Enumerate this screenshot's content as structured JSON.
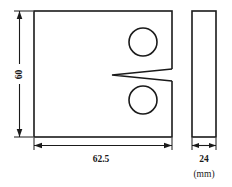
{
  "drawing": {
    "title": "CT specimen engineering drawing",
    "unit_label": "(mm)",
    "views": {
      "front": {
        "name": "front-view",
        "width_value": "62.5",
        "height_value": "60",
        "holes": [
          {
            "name": "upper-hole",
            "cx": 143,
            "cy": 42,
            "r": 14
          },
          {
            "name": "lower-hole",
            "cx": 143,
            "cy": 100,
            "r": 14
          }
        ],
        "notch": {
          "name": "v-notch",
          "tip_x": 112,
          "mouth_x": 172,
          "center_y": 75,
          "half_opening": 5.5
        },
        "rect": {
          "x": 34,
          "y": 11,
          "w": 138,
          "h": 126
        }
      },
      "side": {
        "name": "side-view",
        "thickness_value": "24",
        "rect": {
          "x": 192,
          "y": 11,
          "w": 24,
          "h": 126
        }
      }
    },
    "dimensions": [
      {
        "name": "height-dimension",
        "label": "60",
        "orientation": "vertical"
      },
      {
        "name": "width-dimension",
        "label": "62.5",
        "orientation": "horizontal"
      },
      {
        "name": "thickness-dimension",
        "label": "24",
        "orientation": "horizontal"
      }
    ],
    "colors": {
      "line": "#1a1a1a",
      "background": "#ffffff"
    }
  }
}
